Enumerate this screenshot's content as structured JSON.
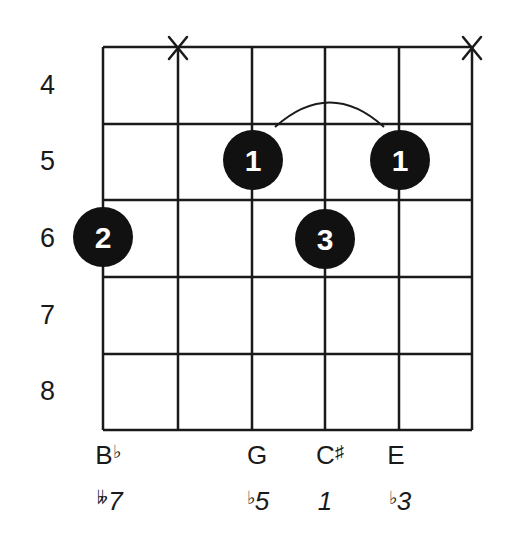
{
  "diagram": {
    "type": "guitar-chord-diagram",
    "start_fret": 4,
    "fret_numbers": [
      "4",
      "5",
      "6",
      "7",
      "8"
    ],
    "strings": 6,
    "frets_shown": 5,
    "muted_strings": [
      2,
      6
    ],
    "muted_symbol": "X",
    "barre": {
      "finger": "1",
      "fret": 5,
      "from_string": 3,
      "to_string": 5
    },
    "dots": [
      {
        "string": 3,
        "fret": 5,
        "finger": "1"
      },
      {
        "string": 5,
        "fret": 5,
        "finger": "1"
      },
      {
        "string": 1,
        "fret": 6,
        "finger": "2"
      },
      {
        "string": 4,
        "fret": 6,
        "finger": "3"
      }
    ],
    "notes": [
      {
        "string": 1,
        "letter": "B",
        "accidental": "♭"
      },
      {
        "string": 3,
        "letter": "G",
        "accidental": ""
      },
      {
        "string": 4,
        "letter": "C",
        "accidental": "♯"
      },
      {
        "string": 5,
        "letter": "E",
        "accidental": ""
      }
    ],
    "intervals": [
      {
        "string": 1,
        "accidental": "𝄫",
        "degree": "7"
      },
      {
        "string": 3,
        "accidental": "♭",
        "degree": "5"
      },
      {
        "string": 4,
        "accidental": "",
        "degree": "1"
      },
      {
        "string": 5,
        "accidental": "♭",
        "degree": "3"
      }
    ],
    "colors": {
      "line": "#1a1a1a",
      "dot": "#111111",
      "dot_text": "#ffffff"
    }
  }
}
